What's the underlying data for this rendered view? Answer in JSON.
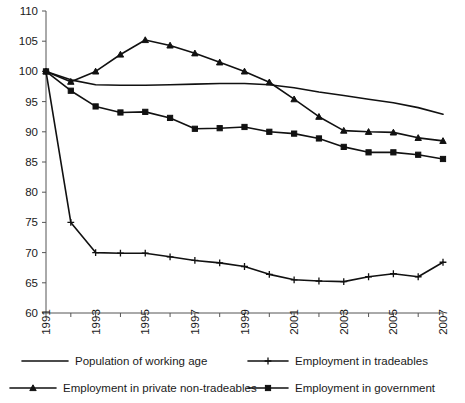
{
  "chart_data": {
    "type": "line",
    "title": "",
    "subtitle": "",
    "xlabel": "",
    "ylabel": "",
    "x": [
      1991,
      1992,
      1993,
      1994,
      1995,
      1996,
      1997,
      1998,
      1999,
      2000,
      2001,
      2002,
      2003,
      2004,
      2005,
      2006,
      2007
    ],
    "xlim": [
      1991,
      2007
    ],
    "ylim": [
      60,
      110
    ],
    "yticks": [
      60,
      65,
      70,
      75,
      80,
      85,
      90,
      95,
      100,
      105,
      110
    ],
    "xticks": [
      1991,
      1992,
      1993,
      1994,
      1995,
      1996,
      1997,
      1998,
      1999,
      2000,
      2001,
      2002,
      2003,
      2004,
      2005,
      2006,
      2007
    ],
    "xtick_labels": [
      "1991",
      "",
      "1993",
      "",
      "1995",
      "",
      "1997",
      "",
      "1999",
      "",
      "2001",
      "",
      "2003",
      "",
      "2005",
      "",
      "2007"
    ],
    "ytick_labels": [
      "60",
      "65",
      "70",
      "75",
      "80",
      "85",
      "90",
      "95",
      "100",
      "105",
      "110"
    ],
    "grid": false,
    "legend_position": "bottom",
    "series": [
      {
        "name": "Population of working age",
        "marker": "none",
        "color": "#111111",
        "values": [
          100.0,
          98.6,
          97.8,
          97.7,
          97.7,
          97.8,
          97.9,
          98.0,
          98.0,
          97.8,
          97.3,
          96.6,
          96.0,
          95.4,
          94.8,
          94.0,
          92.9
        ]
      },
      {
        "name": "Employment in tradeables",
        "marker": "plus",
        "color": "#111111",
        "values": [
          100.0,
          75.0,
          70.0,
          69.9,
          69.9,
          69.3,
          68.7,
          68.3,
          67.7,
          66.4,
          65.5,
          65.3,
          65.2,
          66.0,
          66.5,
          66.0,
          68.4
        ]
      },
      {
        "name": "Employment in private non-tradeables",
        "marker": "triangle",
        "color": "#111111",
        "values": [
          100.0,
          98.3,
          100.0,
          102.8,
          105.2,
          104.3,
          103.0,
          101.5,
          100.0,
          98.2,
          95.4,
          92.5,
          90.2,
          90.0,
          89.9,
          89.0,
          88.5
        ]
      },
      {
        "name": "Employment in government",
        "marker": "square",
        "color": "#111111",
        "values": [
          100.0,
          96.8,
          94.2,
          93.2,
          93.3,
          92.3,
          90.5,
          90.6,
          90.8,
          90.0,
          89.7,
          88.9,
          87.5,
          86.6,
          86.6,
          86.2,
          85.5
        ]
      }
    ]
  },
  "legend": {
    "entries": [
      {
        "label": "Population of working age",
        "marker": "none"
      },
      {
        "label": "Employment in tradeables",
        "marker": "plus"
      },
      {
        "label": "Employment in private non-tradeables",
        "marker": "triangle"
      },
      {
        "label": "Employment in government",
        "marker": "square"
      }
    ]
  }
}
